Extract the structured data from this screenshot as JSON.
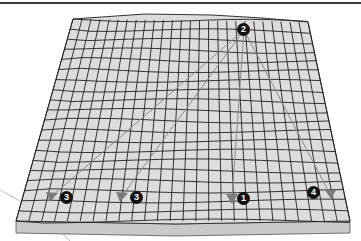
{
  "diagram": {
    "colors": {
      "surface": "#d9d9d9",
      "grid_line": "#222222",
      "slab_edge": "#bdbdbd",
      "arrow": "#8a8a8a",
      "badge_bg": "#111111",
      "badge_text": "#ffffff"
    },
    "source": {
      "label": "2",
      "x": 244,
      "y": 30
    },
    "targets": [
      {
        "label": "3",
        "x": 66,
        "y": 198
      },
      {
        "label": "3",
        "x": 136,
        "y": 198
      },
      {
        "label": "1",
        "x": 243,
        "y": 198
      },
      {
        "label": "4",
        "x": 313,
        "y": 193
      }
    ]
  }
}
